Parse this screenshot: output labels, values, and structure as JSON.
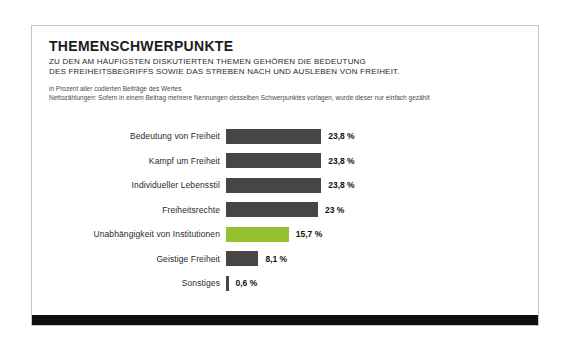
{
  "card": {
    "title": "THEMENSCHWERPUNKTE",
    "subtitle_line1": "ZU DEN AM HÄUFIGSTEN DISKUTIERTEN THEMEN GEHÖREN DIE BEDEUTUNG",
    "subtitle_line2": "DES FREIHEITSBEGRIFFS SOWIE DAS STREBEN NACH UND AUSLEBEN VON FREIHEIT.",
    "note_line1": "in Prozent aller codierten Beiträge des Wertes",
    "note_line2": "Nettozählungen: Sofern in einem Beitrag mehrere Nennungen desselben Schwerpunktes vorlagen, wurde dieser nur einfach gezählt"
  },
  "chart_data": {
    "type": "bar",
    "orientation": "horizontal",
    "title": "THEMENSCHWERPUNKTE",
    "xlabel": "",
    "ylabel": "",
    "unit": "%",
    "xlim": [
      0,
      25
    ],
    "grid": false,
    "legend": false,
    "categories": [
      "Bedeutung von Freiheit",
      "Kampf um Freiheit",
      "Individueller Lebensstil",
      "Freiheitsrechte",
      "Unabhängigkeit von Institutionen",
      "Geistige Freiheit",
      "Sonstiges"
    ],
    "values": [
      23.8,
      23.8,
      23.8,
      23,
      15.7,
      8.1,
      0.6
    ],
    "value_labels": [
      "23,8 %",
      "23,8 %",
      "23,8 %",
      "23 %",
      "15,7 %",
      "8,1 %",
      "0,6 %"
    ],
    "highlight_index": 4,
    "bar_color": "#474645",
    "highlight_color": "#95c12f"
  }
}
